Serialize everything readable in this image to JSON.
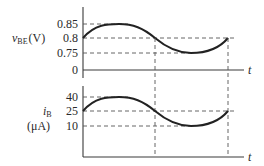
{
  "top_plot": {
    "ylabel_main": "v",
    "ylabel_sub": "BE",
    "ylabel_unit": "(V)",
    "ticks": [
      "0.85",
      "0.8",
      "0.75",
      "0"
    ],
    "xlabel": "t"
  },
  "bottom_plot": {
    "ylabel_main": "i",
    "ylabel_sub": "B",
    "ylabel_unit": "(μA)",
    "ticks": [
      "40",
      "25",
      "10"
    ],
    "xlabel": "t"
  },
  "colors": {
    "line": "#222222",
    "dashed": "#555555",
    "background": "#ffffff"
  }
}
